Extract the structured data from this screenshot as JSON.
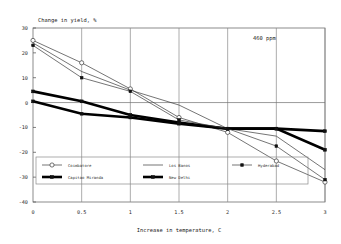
{
  "chart_data": {
    "type": "line",
    "title": "",
    "xlabel": "Increase in temperature, C",
    "ylabel": "Change in yield, %",
    "annotation": "460  ppm",
    "x": [
      0,
      0.5,
      1,
      1.5,
      2,
      2.5,
      3
    ],
    "xlim": [
      0,
      3
    ],
    "ylim": [
      -40,
      30
    ],
    "xticks": [
      "0",
      "0.5",
      "1",
      "1.5",
      "2",
      "2.5",
      "3"
    ],
    "yticks": [
      "30",
      "20",
      "10",
      "0",
      "-10",
      "-20",
      "-30",
      "-40"
    ],
    "grid": "vertical",
    "legend_position": "inside-lower-left",
    "series": [
      {
        "name": "Coimbatore",
        "style": "thin-open-circle",
        "values": [
          25,
          16,
          5.5,
          -6,
          -12,
          -23.5,
          -32
        ]
      },
      {
        "name": "Capitao Miranda",
        "style": "thick-solid",
        "values": [
          4.5,
          0.5,
          -5,
          -8,
          -10.5,
          -10.5,
          -19
        ]
      },
      {
        "name": "Los Banos",
        "style": "thin-plain",
        "values": [
          24,
          12.5,
          5,
          -1,
          -10.5,
          -13.5,
          -27
        ]
      },
      {
        "name": "New Delhi",
        "style": "thick-solid",
        "values": [
          0.5,
          -4.5,
          -6,
          -8.5,
          -10.5,
          -10.5,
          -11.5
        ]
      },
      {
        "name": "Hyderabad",
        "style": "thin-solid-marker",
        "values": [
          23,
          10,
          4.5,
          -7,
          -10.5,
          -17.5,
          -31
        ]
      }
    ]
  },
  "legend": {
    "entries": [
      {
        "label": "Coimbatore"
      },
      {
        "label": "Los Banos"
      },
      {
        "label": "Hyderabad"
      },
      {
        "label": "Capitao Miranda"
      },
      {
        "label": "New Delhi"
      }
    ]
  }
}
